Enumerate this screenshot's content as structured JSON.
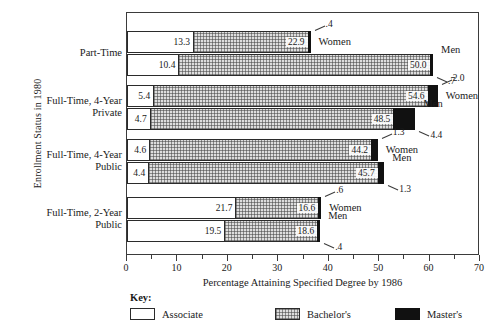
{
  "chart_data": {
    "type": "bar",
    "orientation": "horizontal",
    "stacked": true,
    "title": "",
    "xlabel": "Percentage Attaining Specified Degree by 1986",
    "ylabel": "Enrollment Status in 1980",
    "xlim": [
      0,
      70
    ],
    "xticks": [
      0,
      10,
      20,
      30,
      40,
      50,
      60,
      70
    ],
    "xtick_labels": [
      "0",
      "10",
      "20",
      "30",
      "40",
      "50",
      "60",
      "70"
    ],
    "minor_tick_step": 5,
    "grid": false,
    "legend_title": "Key:",
    "legend_position": "bottom",
    "series": [
      {
        "name": "Associate",
        "fill": "white"
      },
      {
        "name": "Bachelor's",
        "fill": "hatched"
      },
      {
        "name": "Master's",
        "fill": "black"
      }
    ],
    "categories": [
      "Part-Time",
      "Full-Time, 4-Year\nPrivate",
      "Full-Time, 4-Year\nPublic",
      "Full-Time, 2-Year\nPublic"
    ],
    "groups": [
      {
        "category": "Part-Time",
        "bars": [
          {
            "group": "Women",
            "associate": 13.3,
            "bachelors": 22.9,
            "masters": 0.4,
            "associate_label": "13.3",
            "bachelors_label": "22.9",
            "masters_label": ".4"
          },
          {
            "group": "Men",
            "associate": 10.4,
            "bachelors": 50.0,
            "masters": 0.7,
            "associate_label": "10.4",
            "bachelors_label": "50.0",
            "masters_label": ".7"
          }
        ]
      },
      {
        "category": "Full-Time, 4-Year Private",
        "bars": [
          {
            "group": "Women",
            "associate": 5.4,
            "bachelors": 54.6,
            "masters": 2.0,
            "associate_label": "5.4",
            "bachelors_label": "54.6",
            "masters_label": "2.0"
          },
          {
            "group": "Men",
            "associate": 4.7,
            "bachelors": 48.5,
            "masters": 4.4,
            "associate_label": "4.7",
            "bachelors_label": "48.5",
            "masters_label": "4.4"
          }
        ]
      },
      {
        "category": "Full-Time, 4-Year Public",
        "bars": [
          {
            "group": "Women",
            "associate": 4.6,
            "bachelors": 44.2,
            "masters": 1.3,
            "associate_label": "4.6",
            "bachelors_label": "44.2",
            "masters_label": "1.3"
          },
          {
            "group": "Men",
            "associate": 4.4,
            "bachelors": 45.7,
            "masters": 1.3,
            "associate_label": "4.4",
            "bachelors_label": "45.7",
            "masters_label": "1.3"
          }
        ]
      },
      {
        "category": "Full-Time, 2-Year Public",
        "bars": [
          {
            "group": "Women",
            "associate": 21.7,
            "bachelors": 16.6,
            "masters": 0.6,
            "associate_label": "21.7",
            "bachelors_label": "16.6",
            "masters_label": ".6"
          },
          {
            "group": "Men",
            "associate": 19.5,
            "bachelors": 18.6,
            "masters": 0.4,
            "associate_label": "19.5",
            "bachelors_label": "18.6",
            "masters_label": ".4"
          }
        ]
      }
    ]
  },
  "axes": {
    "y_title": "Enrollment Status in 1980",
    "x_title": "Percentage Attaining Specified Degree by 1986",
    "category_labels": [
      "Part-Time",
      "Full-Time, 4-Year\nPrivate",
      "Full-Time, 4-Year\nPublic",
      "Full-Time, 2-Year\nPublic"
    ],
    "x_tick_labels": [
      "0",
      "10",
      "20",
      "30",
      "40",
      "50",
      "60",
      "70"
    ]
  },
  "key": {
    "title": "Key:",
    "items": [
      {
        "label": "Associate",
        "swatch": "associate-swatch"
      },
      {
        "label": "Bachelor's",
        "swatch": "bachelors-swatch"
      },
      {
        "label": "Master's",
        "swatch": "masters-swatch"
      }
    ]
  },
  "colors": {
    "associate": "#ffffff",
    "bachelors": "#dedede",
    "masters": "#111111",
    "frame": "#3b3b3b",
    "text": "#1a1a1a"
  }
}
